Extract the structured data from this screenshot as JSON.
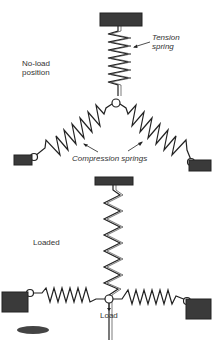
{
  "diagram": {
    "labels": {
      "tension_spring": "Tension spring",
      "tension_line1": "Tension",
      "tension_line2": "spring",
      "no_load_line1": "No-load",
      "no_load_line2": "position",
      "compression_springs": "Compression springs",
      "loaded": "Loaded",
      "load": "Load"
    },
    "colors": {
      "ink": "#222222",
      "block_fill": "#3a3a3a",
      "background": "#ffffff"
    }
  }
}
